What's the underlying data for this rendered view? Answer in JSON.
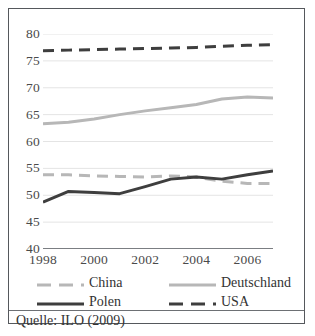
{
  "chart_data": {
    "type": "line",
    "title": "",
    "xlabel": "",
    "ylabel": "",
    "xlim": [
      1998,
      2007
    ],
    "ylim": [
      40,
      80
    ],
    "yticks": [
      40,
      45,
      50,
      55,
      60,
      65,
      70,
      75,
      80
    ],
    "ytick_labels": [
      "40",
      "45",
      "50",
      "55",
      "60",
      "65",
      "70",
      "75",
      "80"
    ],
    "xticks": [
      1998,
      2000,
      2002,
      2004,
      2006
    ],
    "xtick_labels": [
      "1998",
      "2000",
      "2002",
      "2004",
      "2006"
    ],
    "x": [
      1998,
      1999,
      2000,
      2001,
      2002,
      2003,
      2004,
      2005,
      2006,
      2007
    ],
    "grid": "horizontal",
    "legend_position": "below-axis",
    "series": [
      {
        "name": "China",
        "color": "#b7b7b7",
        "style": "dashed",
        "values": [
          53.8,
          53.8,
          53.6,
          53.5,
          53.4,
          53.6,
          53.4,
          52.6,
          52.2,
          52.2
        ]
      },
      {
        "name": "Deutschland",
        "color": "#b7b7b7",
        "style": "solid",
        "values": [
          63.3,
          63.6,
          64.2,
          65.0,
          65.7,
          66.3,
          66.9,
          67.9,
          68.3,
          68.1
        ]
      },
      {
        "name": "Polen",
        "color": "#3e3e3e",
        "style": "solid",
        "values": [
          48.7,
          50.7,
          50.5,
          50.3,
          51.6,
          53.0,
          53.4,
          53.0,
          53.8,
          54.5
        ]
      },
      {
        "name": "USA",
        "color": "#3e3e3e",
        "style": "dashed",
        "values": [
          76.9,
          77.0,
          77.1,
          77.2,
          77.3,
          77.4,
          77.5,
          77.7,
          77.9,
          78.0
        ]
      }
    ]
  },
  "legend": {
    "items": [
      {
        "label": "China",
        "series": "China",
        "row": 0,
        "col": 0
      },
      {
        "label": "Deutschland",
        "series": "Deutschland",
        "row": 0,
        "col": 1
      },
      {
        "label": "Polen",
        "series": "Polen",
        "row": 1,
        "col": 0
      },
      {
        "label": "USA",
        "series": "USA",
        "row": 1,
        "col": 1
      }
    ]
  },
  "source": {
    "note": "Quelle: ILO (2009)"
  }
}
